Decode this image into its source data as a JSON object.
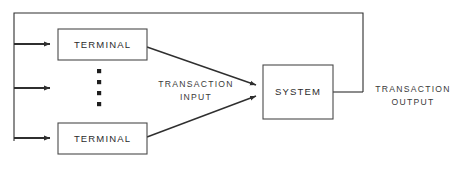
{
  "diagram": {
    "background_color": "#ffffff",
    "line_color": "#2f2f2f",
    "box_stroke_color": "#4a4a4a",
    "box_fill_color": "#ffffff",
    "text_color": "#2b2b2b",
    "nodes": [
      {
        "id": "terminal-top",
        "label": "TERMINAL",
        "x": 58,
        "y": 29,
        "w": 89,
        "h": 31
      },
      {
        "id": "terminal-bottom",
        "label": "TERMINAL",
        "x": 58,
        "y": 123,
        "w": 89,
        "h": 31
      },
      {
        "id": "system",
        "label": "SYSTEM",
        "x": 263,
        "y": 65,
        "w": 70,
        "h": 54
      }
    ],
    "edge_labels": [
      {
        "id": "transaction-input",
        "line1": "TRANSACTION",
        "line2": "INPUT",
        "x": 196,
        "y": 84
      },
      {
        "id": "transaction-output",
        "line1": "TRANSACTION",
        "line2": "OUTPUT",
        "x": 413,
        "y": 89
      }
    ],
    "ellipsis": {
      "id": "terminal-ellipsis",
      "count": 4,
      "x": 99,
      "y_start": 71,
      "y_step": 11,
      "radius": 2.1
    },
    "arrows": [
      {
        "id": "input-arrow-top",
        "to_node": "terminal-top"
      },
      {
        "id": "input-arrow-middle",
        "to_node": "ellipsis"
      },
      {
        "id": "input-arrow-bottom",
        "to_node": "terminal-bottom"
      },
      {
        "id": "terminal-top-to-system",
        "to_node": "system"
      },
      {
        "id": "terminal-bottom-to-system",
        "to_node": "system"
      }
    ],
    "feedback_loop": {
      "id": "output-feedback-loop",
      "top_y": 13,
      "left_x": 14,
      "right_x": 363
    }
  }
}
